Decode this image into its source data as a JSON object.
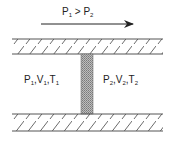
{
  "diagram": {
    "flow_label": {
      "p1": "P",
      "p1_sub": "1",
      "gt": " > ",
      "p2": "P",
      "p2_sub": "2"
    },
    "left_state": {
      "p": "P",
      "p_sub": "1",
      "v": "V",
      "v_sub": "1",
      "t": "T",
      "t_sub": "1"
    },
    "right_state": {
      "p": "P",
      "p_sub": "2",
      "v": "V",
      "v_sub": "2",
      "t": "T",
      "t_sub": "2"
    },
    "elements": [
      "flow-arrow",
      "top-wall-hatched",
      "bottom-wall-hatched",
      "porous-plug"
    ],
    "colors": {
      "line": "#333333",
      "plug": "#9a9a9a",
      "background": "#ffffff"
    }
  }
}
